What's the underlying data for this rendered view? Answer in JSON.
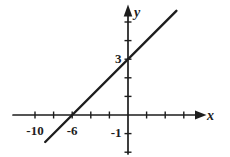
{
  "figure": {
    "background_color": "#ffffff",
    "ink_color": "#1d1d1d"
  },
  "chart_data": {
    "type": "line",
    "title": "",
    "xlabel": "x",
    "ylabel": "y",
    "xlim": [
      -12.4,
      8.5
    ],
    "ylim": [
      -2.2,
      6.0
    ],
    "grid": false,
    "legend": null,
    "x_tick_step": 2,
    "y_tick_step": 1,
    "x_ticks": [
      -10,
      -8,
      -6,
      -4,
      -2,
      2,
      4,
      6
    ],
    "y_ticks": [
      1,
      2,
      3,
      4,
      5,
      -1,
      -2
    ],
    "x_tick_labels": [
      {
        "value": -10,
        "label": "-10"
      },
      {
        "value": -6,
        "label": "-6"
      }
    ],
    "y_tick_labels": [
      {
        "value": 3,
        "label": "3"
      },
      {
        "value": -1,
        "label": "-1"
      }
    ],
    "series": [
      {
        "name": "line",
        "equation": "y = (1/2)x + 3",
        "slope": 0.5,
        "y_intercept": 3,
        "x_intercept": -6,
        "points": [
          [
            -6,
            0
          ],
          [
            0,
            3
          ]
        ],
        "x_draw_range": [
          -8.9,
          5.2
        ]
      }
    ]
  }
}
